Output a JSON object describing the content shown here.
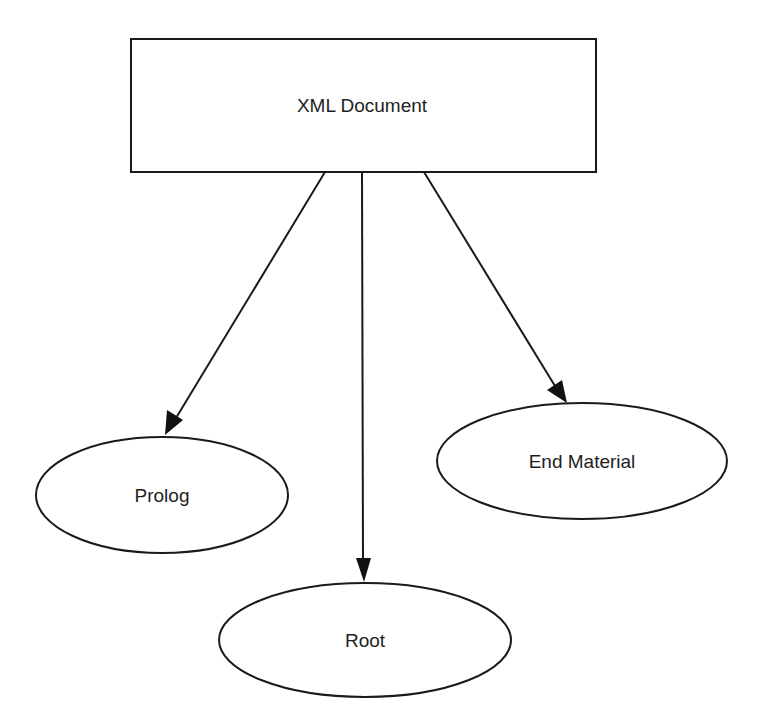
{
  "diagram": {
    "type": "tree",
    "colors": {
      "stroke": "#1a1a1a",
      "fill": "#ffffff",
      "text": "#1e1e1e",
      "background": "#ffffff"
    },
    "root_node": {
      "label": "XML Document",
      "shape": "rectangle"
    },
    "children": [
      {
        "label": "Prolog",
        "shape": "ellipse"
      },
      {
        "label": "Root",
        "shape": "ellipse"
      },
      {
        "label": "End Material",
        "shape": "ellipse"
      }
    ],
    "edges": [
      {
        "from": "XML Document",
        "to": "Prolog"
      },
      {
        "from": "XML Document",
        "to": "Root"
      },
      {
        "from": "XML Document",
        "to": "End Material"
      }
    ]
  }
}
